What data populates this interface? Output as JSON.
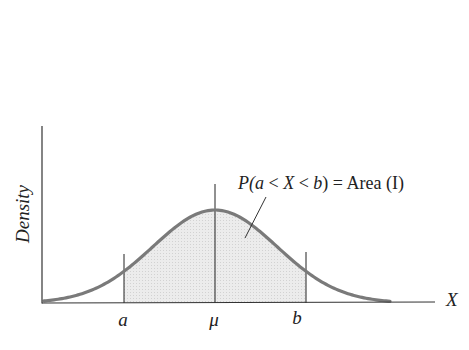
{
  "figure": {
    "type": "normal-distribution-diagram",
    "y_axis_label": "Density",
    "x_axis_label": "X",
    "tick_labels": {
      "a": "a",
      "mu": "μ",
      "b": "b"
    },
    "annotation": {
      "prefix": "P(",
      "a": "a",
      "lt1": " < ",
      "X": "X",
      "lt2": " < ",
      "b": "b",
      "suffix": ") = Area (I)"
    },
    "caption_partial": "",
    "colors": {
      "curve": "#777777",
      "shaded_area": "#e6e6e6",
      "axis": "#333333"
    }
  }
}
